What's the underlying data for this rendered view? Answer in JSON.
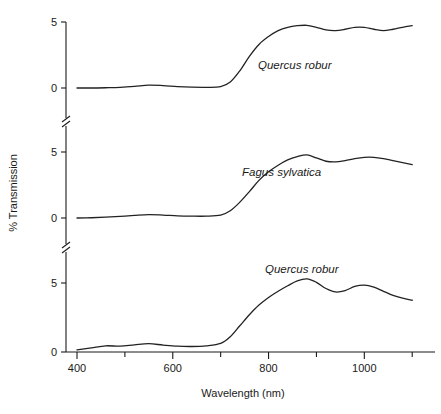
{
  "chart_data": {
    "type": "line",
    "title": "",
    "xlabel": "Wavelength (nm)",
    "ylabel": "% Transmission",
    "xlim": [
      400,
      1110
    ],
    "xticks": [
      400,
      500,
      600,
      700,
      800,
      900,
      1000,
      1100
    ],
    "xticklabels": [
      "400",
      "",
      "600",
      "",
      "800",
      "",
      "1000",
      ""
    ],
    "grid": false,
    "legend_position": "inline-annotation",
    "panel_layout": "three stacked panels sharing one x-axis, y-axis broken between panels",
    "axis_breaks": 2,
    "panels": [
      {
        "index": 0,
        "position": "top",
        "ylim": [
          0,
          5
        ],
        "yticks": [
          0,
          5
        ],
        "yticklabels": [
          "0",
          "5"
        ],
        "series_name": "Quercus robur",
        "annotation": "Quercus robur",
        "x": [
          400,
          430,
          460,
          490,
          520,
          550,
          580,
          610,
          640,
          670,
          700,
          720,
          740,
          760,
          780,
          800,
          820,
          840,
          860,
          880,
          900,
          920,
          940,
          960,
          980,
          1000,
          1020,
          1040,
          1060,
          1080,
          1100
        ],
        "y": [
          0.0,
          0.0,
          0.02,
          0.05,
          0.12,
          0.22,
          0.18,
          0.1,
          0.06,
          0.05,
          0.1,
          0.45,
          1.3,
          2.4,
          3.3,
          3.9,
          4.35,
          4.6,
          4.72,
          4.75,
          4.6,
          4.4,
          4.35,
          4.45,
          4.6,
          4.6,
          4.45,
          4.35,
          4.45,
          4.6,
          4.72
        ]
      },
      {
        "index": 1,
        "position": "middle",
        "ylim": [
          0,
          5
        ],
        "yticks": [
          0,
          5
        ],
        "yticklabels": [
          "0",
          "5"
        ],
        "series_name": "Fagus sylvatica",
        "annotation": "Fagus sylvatica",
        "x": [
          400,
          430,
          460,
          490,
          520,
          550,
          580,
          610,
          640,
          670,
          700,
          720,
          740,
          760,
          780,
          800,
          820,
          840,
          860,
          880,
          900,
          920,
          940,
          960,
          980,
          1000,
          1020,
          1040,
          1060,
          1080,
          1100
        ],
        "y": [
          0.0,
          0.02,
          0.06,
          0.12,
          0.2,
          0.26,
          0.22,
          0.16,
          0.14,
          0.14,
          0.22,
          0.55,
          1.2,
          2.0,
          2.85,
          3.5,
          4.0,
          4.4,
          4.65,
          4.78,
          4.55,
          4.3,
          4.25,
          4.35,
          4.5,
          4.6,
          4.6,
          4.5,
          4.35,
          4.2,
          4.05
        ]
      },
      {
        "index": 2,
        "position": "bottom",
        "ylim": [
          0,
          5
        ],
        "yticks": [
          0,
          5
        ],
        "yticklabels": [
          "0",
          "5"
        ],
        "series_name": "Quercus robur",
        "annotation": "Quercus robur",
        "x": [
          400,
          430,
          460,
          490,
          520,
          550,
          580,
          610,
          640,
          670,
          700,
          720,
          740,
          760,
          780,
          800,
          820,
          840,
          860,
          880,
          900,
          920,
          940,
          960,
          980,
          1000,
          1020,
          1040,
          1060,
          1080,
          1100
        ],
        "y": [
          0.15,
          0.3,
          0.45,
          0.42,
          0.52,
          0.6,
          0.5,
          0.42,
          0.4,
          0.45,
          0.62,
          1.1,
          1.9,
          2.7,
          3.4,
          3.95,
          4.4,
          4.8,
          5.15,
          5.3,
          5.05,
          4.6,
          4.35,
          4.45,
          4.75,
          4.85,
          4.7,
          4.4,
          4.1,
          3.9,
          3.75
        ]
      }
    ],
    "line_color": "#222222",
    "line_width": 1.3
  }
}
